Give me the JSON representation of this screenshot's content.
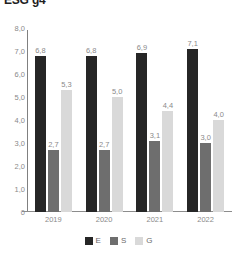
{
  "chart_data": {
    "type": "bar",
    "title": "ESG g4",
    "xlabel": "",
    "ylabel": "",
    "categories": [
      "2019",
      "2020",
      "2021",
      "2022"
    ],
    "series": [
      {
        "name": "E",
        "color": "#262626",
        "values": [
          6.8,
          6.8,
          6.9,
          7.1
        ],
        "labels": [
          "6,8",
          "6,8",
          "6,9",
          "7,1"
        ]
      },
      {
        "name": "S",
        "color": "#6e6e6e",
        "values": [
          2.7,
          2.7,
          3.1,
          3.0
        ],
        "labels": [
          "2,7",
          "2,7",
          "3,1",
          "3,0"
        ]
      },
      {
        "name": "G",
        "color": "#d9d9d9",
        "values": [
          5.3,
          5.0,
          4.4,
          4.0
        ],
        "labels": [
          "5,3",
          "5,0",
          "4,4",
          "4,0"
        ]
      }
    ],
    "ylim": [
      0,
      8
    ],
    "yticks": [
      8.0,
      7.0,
      6.0,
      5.0,
      4.0,
      3.0,
      2.0,
      1.0,
      0
    ],
    "ytick_labels": [
      "8,0",
      "7,0",
      "6,0",
      "5,0",
      "4,0",
      "3,0",
      "2,0",
      "1,0",
      "0"
    ],
    "grid": false,
    "legend_position": "bottom",
    "legend": [
      "E",
      "S",
      "G"
    ]
  }
}
